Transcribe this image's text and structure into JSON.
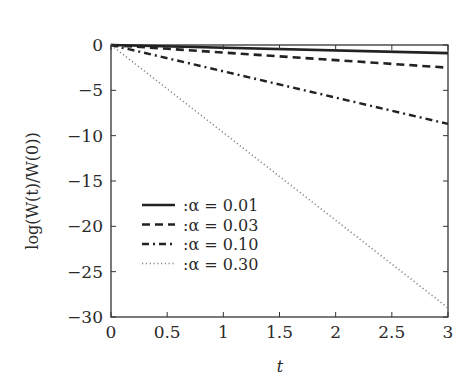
{
  "chart_data": {
    "type": "line",
    "title": "",
    "xlabel": "t",
    "ylabel": "log(W(t)/W(0))",
    "xlim": [
      0,
      3
    ],
    "ylim": [
      -30,
      0
    ],
    "xticks": [
      0,
      0.5,
      1,
      1.5,
      2,
      2.5,
      3
    ],
    "xtick_labels": [
      "0",
      "0.5",
      "1",
      "1.5",
      "2",
      "2.5",
      "3"
    ],
    "yticks": [
      0,
      -5,
      -10,
      -15,
      -20,
      -25,
      -30
    ],
    "ytick_labels": [
      "0",
      "−5",
      "−10",
      "−15",
      "−20",
      "−25",
      "−30"
    ],
    "grid": false,
    "legend_placement": "lower-left",
    "series": [
      {
        "name": ":α = 0.01",
        "style": "solid",
        "x": [
          0,
          3
        ],
        "y": [
          0,
          -0.9
        ]
      },
      {
        "name": ":α = 0.03",
        "style": "dashed",
        "x": [
          0,
          3
        ],
        "y": [
          0,
          -2.5
        ]
      },
      {
        "name": ":α = 0.10",
        "style": "dashdot",
        "x": [
          0,
          3
        ],
        "y": [
          0,
          -8.7
        ]
      },
      {
        "name": ":α = 0.30",
        "style": "dotted",
        "x": [
          0,
          3
        ],
        "y": [
          0,
          -29.0
        ]
      }
    ],
    "colors": {
      "axes": "#333333",
      "line": "#222222",
      "dotted": "#888888"
    }
  }
}
